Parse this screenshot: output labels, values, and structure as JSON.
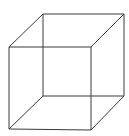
{
  "figure": {
    "type": "necker-cube",
    "stroke_color": "#3a3a3a",
    "stroke_width": 1,
    "background": "#ffffff",
    "vertices": {
      "front_top_left": [
        9,
        47
      ],
      "front_top_right": [
        91,
        47
      ],
      "front_bottom_left": [
        9,
        129
      ],
      "front_bottom_right": [
        91,
        130
      ],
      "back_top_left": [
        43,
        14
      ],
      "back_top_right": [
        124,
        14
      ],
      "back_bottom_left": [
        43,
        96
      ],
      "back_bottom_right": [
        124,
        96
      ]
    }
  }
}
